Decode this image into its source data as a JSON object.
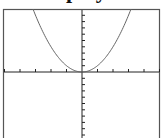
{
  "heading": {
    "text": "Graph y"
  },
  "chart_data": {
    "type": "line",
    "title": "",
    "function": "y = x^2",
    "xlabel": "",
    "ylabel": "",
    "xlim": [
      -5,
      5
    ],
    "ylim": [
      -10,
      10
    ],
    "x_tick_step": 1,
    "y_tick_step": 1,
    "grid": false,
    "legend": null,
    "series": [
      {
        "name": "y = x^2",
        "x": [
          -3.16,
          -3,
          -2,
          -1,
          0,
          1,
          2,
          3,
          3.16
        ],
        "y": [
          10,
          9,
          4,
          1,
          0,
          1,
          4,
          9,
          10
        ]
      }
    ]
  },
  "colors": {
    "frame": "#555555",
    "axis": "#222222",
    "curve": "#666666",
    "background": "#ffffff"
  }
}
